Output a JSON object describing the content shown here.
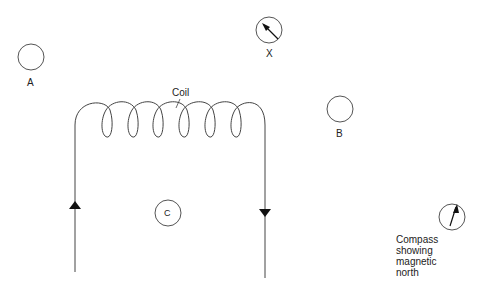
{
  "diagram": {
    "coil_label": "Coil",
    "points": [
      {
        "id": "A",
        "label": "A"
      },
      {
        "id": "B",
        "label": "B"
      },
      {
        "id": "C",
        "label": "C"
      },
      {
        "id": "X",
        "label": "X",
        "has_compass": true
      }
    ],
    "compass_key": {
      "line1": "Compass",
      "line2": "showing",
      "line3": "magnetic",
      "line4": "north"
    },
    "current_direction": {
      "left_wire": "up",
      "right_wire": "down"
    },
    "colors": {
      "stroke": "#333333",
      "text": "#222222"
    }
  }
}
